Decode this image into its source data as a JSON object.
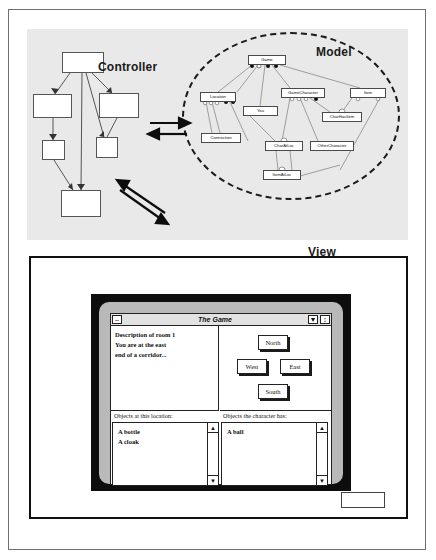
{
  "labels": {
    "controller": "Controller",
    "model": "Model",
    "view": "View"
  },
  "model_nodes": [
    {
      "id": "game",
      "label": "Game",
      "x": 248,
      "y": 55,
      "w": 38,
      "h": 10
    },
    {
      "id": "location",
      "label": "Location",
      "x": 200,
      "y": 92,
      "w": 36,
      "h": 10
    },
    {
      "id": "gamecharacter",
      "label": "GameCharacter",
      "x": 281,
      "y": 88,
      "w": 44,
      "h": 10
    },
    {
      "id": "item",
      "label": "Item",
      "x": 350,
      "y": 88,
      "w": 36,
      "h": 10
    },
    {
      "id": "you",
      "label": "You",
      "x": 243,
      "y": 106,
      "w": 35,
      "h": 10
    },
    {
      "id": "charhasitem",
      "label": "CharHasItem",
      "x": 322,
      "y": 112,
      "w": 40,
      "h": 10
    },
    {
      "id": "connection",
      "label": "Connection",
      "x": 201,
      "y": 133,
      "w": 40,
      "h": 10
    },
    {
      "id": "charatloc",
      "label": "CharAtLoc",
      "x": 265,
      "y": 141,
      "w": 38,
      "h": 10
    },
    {
      "id": "othercharacter",
      "label": "OtherCharacter",
      "x": 310,
      "y": 141,
      "w": 44,
      "h": 10
    },
    {
      "id": "itematloc",
      "label": "ItemAtLoc",
      "x": 263,
      "y": 170,
      "w": 38,
      "h": 10
    }
  ],
  "view_window": {
    "title": "The Game",
    "minimize_glyph": "–",
    "collapse_glyph": "▼",
    "resize_glyph": "↕",
    "description_lines": [
      "Description of room 1",
      "You are at the east",
      "end of a corridor..."
    ],
    "direction_buttons": {
      "north": "North",
      "west": "West",
      "east": "East",
      "south": "South"
    },
    "location_list": {
      "header": "Objects at this location:",
      "items": [
        "A bottle",
        "A cloak"
      ]
    },
    "character_list": {
      "header": "Objects the character has:",
      "items": [
        "A ball"
      ]
    },
    "scroll_up_glyph": "▲",
    "scroll_down_glyph": "▼"
  },
  "colors": {
    "panel_background": "#e9e9e9",
    "page_background": "#ffffff",
    "bezel": "#0d0d0d",
    "monitor": "#b9b9b9",
    "outline": "#222222"
  }
}
